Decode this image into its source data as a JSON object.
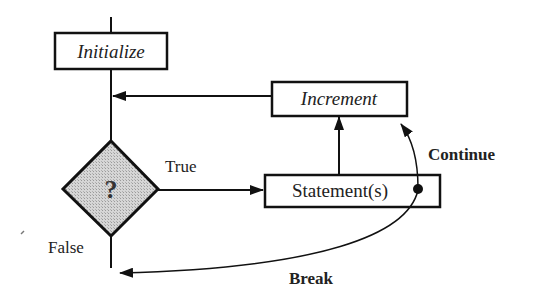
{
  "diagram": {
    "type": "flowchart",
    "title": "",
    "colors": {
      "stroke": "#111111",
      "decision_fill": "#c8c8c8",
      "background": "#ffffff"
    },
    "nodes": {
      "initialize": {
        "label": "Initialize",
        "shape": "rectangle",
        "style": "italic"
      },
      "increment": {
        "label": "Increment",
        "shape": "rectangle",
        "style": "italic"
      },
      "condition": {
        "label": "?",
        "shape": "diamond",
        "style": "bold"
      },
      "statements": {
        "label": "Statement(s)",
        "shape": "rectangle",
        "style": "normal"
      }
    },
    "edges": {
      "true_label": "True",
      "false_label": "False",
      "continue_label": "Continue",
      "break_label": "Break"
    },
    "connections": [
      {
        "from": "entry",
        "to": "initialize"
      },
      {
        "from": "initialize",
        "to": "condition"
      },
      {
        "from": "condition",
        "to": "statements",
        "label": "True"
      },
      {
        "from": "statements",
        "to": "increment"
      },
      {
        "from": "increment",
        "to": "condition"
      },
      {
        "from": "statements",
        "to": "increment",
        "label": "Continue"
      },
      {
        "from": "statements",
        "to": "exit",
        "label": "Break"
      },
      {
        "from": "condition",
        "to": "exit",
        "label": "False"
      }
    ]
  }
}
